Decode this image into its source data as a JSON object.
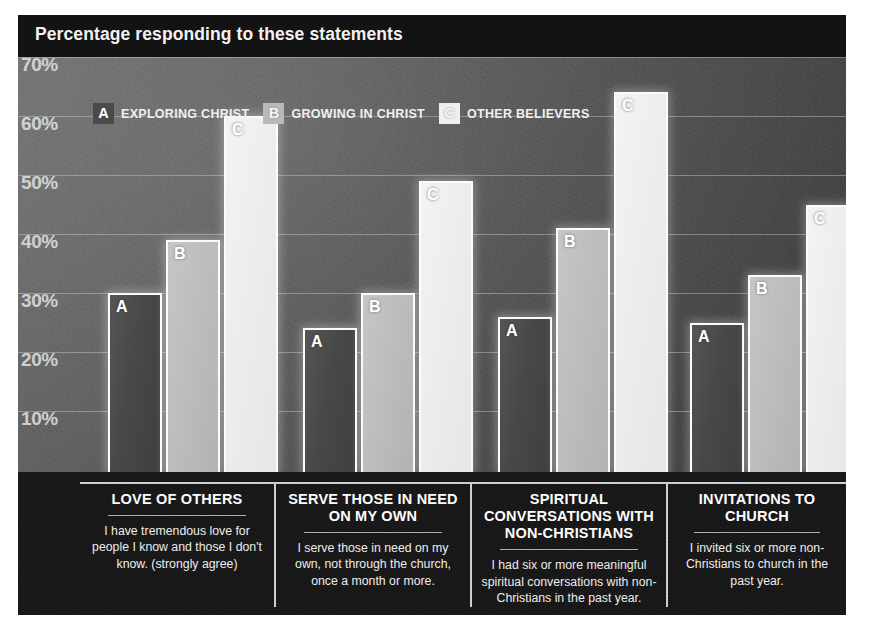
{
  "header": {
    "title": "Percentage responding to these statements"
  },
  "legend": {
    "entries": [
      {
        "key": "A",
        "label": "EXPLORING CHRIST",
        "color": "#4a4a4a"
      },
      {
        "key": "B",
        "label": "GROWING IN CHRIST",
        "color": "#b9b9b9"
      },
      {
        "key": "C",
        "label": "OTHER BELIEVERS",
        "color": "#efefef"
      }
    ]
  },
  "axis": {
    "ticks": [
      "70%",
      "60%",
      "50%",
      "40%",
      "30%",
      "20%",
      "10%"
    ]
  },
  "panels": [
    {
      "title": "LOVE OF OTHERS",
      "desc": "I have tremendous love for people I know and those I don't know. (strongly agree)"
    },
    {
      "title": "SERVE THOSE IN NEED ON MY OWN",
      "desc": "I serve those in need on my own, not through the church, once a month or more."
    },
    {
      "title": "SPIRITUAL CONVERSATIONS WITH NON-CHRISTIANS",
      "desc": "I had six or more meaningful spiritual conversations with non-Christians in the past year."
    },
    {
      "title": "INVITATIONS TO CHURCH",
      "desc": "I invited six or more non-Christians to church in the past year."
    }
  ],
  "chart_data": {
    "type": "bar",
    "title": "Percentage responding to these statements",
    "xlabel": "",
    "ylabel": "Percentage",
    "ylim": [
      0,
      72
    ],
    "grid": true,
    "yticks": [
      10,
      20,
      30,
      40,
      50,
      60,
      70
    ],
    "ytick_labels": [
      "10%",
      "20%",
      "30%",
      "40%",
      "50%",
      "60%",
      "70%"
    ],
    "legend_position": "top-left",
    "categories": [
      "LOVE OF OTHERS",
      "SERVE THOSE IN NEED ON MY OWN",
      "SPIRITUAL CONVERSATIONS WITH NON-CHRISTIANS",
      "INVITATIONS TO CHURCH"
    ],
    "series": [
      {
        "name": "EXPLORING CHRIST",
        "key": "A",
        "color": "#4a4a4a",
        "values": [
          30,
          24,
          26,
          25
        ]
      },
      {
        "name": "GROWING IN CHRIST",
        "key": "B",
        "color": "#b9b9b9",
        "values": [
          39,
          30,
          41,
          33
        ]
      },
      {
        "name": "OTHER BELIEVERS",
        "key": "C",
        "color": "#efefef",
        "values": [
          60,
          49,
          64,
          45
        ]
      }
    ]
  }
}
